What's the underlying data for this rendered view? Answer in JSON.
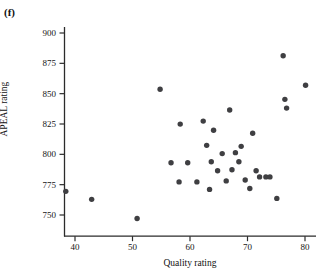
{
  "panel": {
    "label": "(f)"
  },
  "axes": {
    "y_title": "APEAL rating",
    "x_title": "Quality rating",
    "y_ticks": [
      "900",
      "875",
      "850",
      "825",
      "800",
      "775",
      "750"
    ],
    "x_ticks": [
      "40",
      "50",
      "60",
      "70",
      "80"
    ]
  },
  "style": {
    "marker_color": "#3f3f42",
    "axis_color": "#2b2b2b",
    "background": "#ffffff"
  },
  "chart_data": {
    "type": "scatter",
    "title": "(f)",
    "xlabel": "Quality rating",
    "ylabel": "APEAL rating",
    "xlim": [
      34,
      83
    ],
    "ylim": [
      740,
      905
    ],
    "xticks": [
      40,
      50,
      60,
      70,
      80
    ],
    "yticks": [
      750,
      775,
      800,
      825,
      850,
      875,
      900
    ],
    "grid": false,
    "legend": null,
    "marker": "filled-circle",
    "n_points": 33,
    "points": [
      {
        "x": 38.4,
        "y": 769.5
      },
      {
        "x": 42.9,
        "y": 762.9
      },
      {
        "x": 50.8,
        "y": 747.1
      },
      {
        "x": 54.8,
        "y": 853.6
      },
      {
        "x": 56.7,
        "y": 793.1
      },
      {
        "x": 58.3,
        "y": 824.9
      },
      {
        "x": 58.1,
        "y": 777.3
      },
      {
        "x": 59.6,
        "y": 793.1
      },
      {
        "x": 61.2,
        "y": 777.3
      },
      {
        "x": 62.3,
        "y": 827.4
      },
      {
        "x": 62.9,
        "y": 807.4
      },
      {
        "x": 63.4,
        "y": 771.1
      },
      {
        "x": 63.7,
        "y": 793.9
      },
      {
        "x": 64.1,
        "y": 819.9
      },
      {
        "x": 64.8,
        "y": 786.5
      },
      {
        "x": 65.6,
        "y": 800.6
      },
      {
        "x": 66.3,
        "y": 778.1
      },
      {
        "x": 66.9,
        "y": 836.5
      },
      {
        "x": 67.3,
        "y": 787.3
      },
      {
        "x": 67.9,
        "y": 801.4
      },
      {
        "x": 68.5,
        "y": 793.9
      },
      {
        "x": 68.9,
        "y": 806.6
      },
      {
        "x": 69.6,
        "y": 778.9
      },
      {
        "x": 70.4,
        "y": 771.9
      },
      {
        "x": 70.9,
        "y": 817.4
      },
      {
        "x": 71.5,
        "y": 786.5
      },
      {
        "x": 72.1,
        "y": 781.4
      },
      {
        "x": 73.2,
        "y": 781.4
      },
      {
        "x": 73.9,
        "y": 781.4
      },
      {
        "x": 75.1,
        "y": 763.7
      },
      {
        "x": 76.2,
        "y": 881.3
      },
      {
        "x": 76.5,
        "y": 845.3
      },
      {
        "x": 76.8,
        "y": 838.1
      },
      {
        "x": 80.1,
        "y": 856.9
      }
    ]
  }
}
